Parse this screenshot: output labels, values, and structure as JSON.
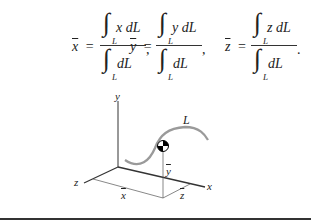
{
  "equations": [
    {
      "lhs_var": "x",
      "lhs": "x",
      "num_integrand": "x dL",
      "den_integrand": "dL",
      "sub": "L",
      "trail": ","
    },
    {
      "lhs_var": "y",
      "lhs": "y",
      "num_integrand": "y dL",
      "den_integrand": "dL",
      "sub": "L",
      "trail": ","
    },
    {
      "lhs_var": "z",
      "lhs": "z",
      "num_integrand": "z dL",
      "den_integrand": "dL",
      "sub": "L",
      "trail": "."
    }
  ],
  "symbols": {
    "equals": "=",
    "integral": "∫"
  },
  "diagram": {
    "axis_labels": {
      "x": "x",
      "y": "y",
      "z": "z"
    },
    "curve_label": "L",
    "centroid_labels": {
      "xbar": "x",
      "ybar": "y",
      "zbar": "z"
    },
    "colors": {
      "curve": "#9a9a9a",
      "axes": "#333333",
      "centroid_marker": "#000000"
    }
  }
}
